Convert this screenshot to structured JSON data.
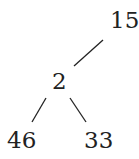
{
  "diagram": {
    "type": "binary-tree",
    "nodes": [
      {
        "id": "root",
        "label": "15"
      },
      {
        "id": "left",
        "label": "2"
      },
      {
        "id": "left-left",
        "label": "46"
      },
      {
        "id": "left-right",
        "label": "33"
      }
    ],
    "edges": [
      {
        "from": "root",
        "to": "left"
      },
      {
        "from": "left",
        "to": "left-left"
      },
      {
        "from": "left",
        "to": "left-right"
      }
    ],
    "colors": {
      "ink": "#222222",
      "background": "#ffffff"
    }
  }
}
